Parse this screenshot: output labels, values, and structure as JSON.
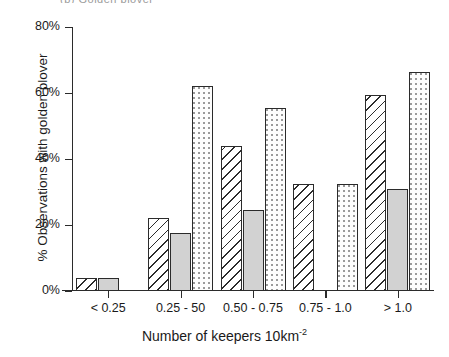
{
  "figure": {
    "panel_caption": "(b)  Golden plover",
    "xlabel_main": "Number of keepers 10km",
    "xlabel_sup": "-2",
    "ylabel": "% Observations with golden plover"
  },
  "chart_data": {
    "type": "bar",
    "title": "",
    "xlabel": "Number of keepers 10km-2",
    "ylabel": "% Observations with golden plover",
    "categories": [
      "< 0.25",
      "0.25 - 50",
      "0.50 - 0.75",
      "0.75 - 1.0",
      "> 1.0"
    ],
    "ylim": [
      0,
      80
    ],
    "yticks": [
      0,
      20,
      40,
      60,
      80
    ],
    "ytick_labels": [
      "0%",
      "20%",
      "40%",
      "60%",
      "80%"
    ],
    "grid": false,
    "legend": "none",
    "series": [
      {
        "name": "hatched",
        "pattern": "diagonal-hatch",
        "values": [
          4,
          22,
          44,
          32.5,
          59.5
        ]
      },
      {
        "name": "grey",
        "pattern": "solid-grey",
        "values": [
          4,
          17.5,
          24.5,
          0,
          31
        ]
      },
      {
        "name": "dotted",
        "pattern": "stipple-dots",
        "values": [
          0,
          62,
          55.5,
          32.5,
          66.5
        ]
      }
    ]
  },
  "style": {
    "axis_color": "#2b2b2b",
    "grey_fill": "#d2d2d2",
    "hatch_color": "#2b2b2b",
    "dot_color": "#9a9a9a",
    "background": "#ffffff"
  }
}
